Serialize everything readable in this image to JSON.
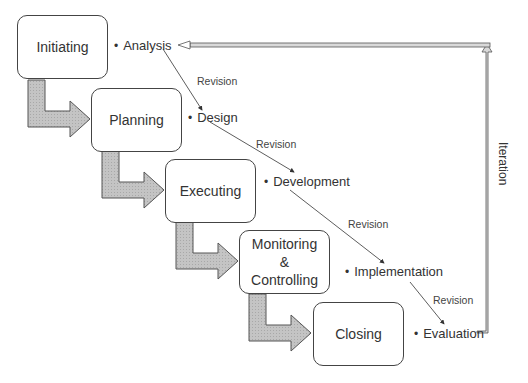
{
  "diagram": {
    "phases": [
      {
        "label": "Initiating"
      },
      {
        "label": "Planning"
      },
      {
        "label": "Executing"
      },
      {
        "label": "Monitoring & Controlling",
        "lines": [
          "Monitoring",
          "&",
          "Controlling"
        ]
      },
      {
        "label": "Closing"
      }
    ],
    "activities": [
      {
        "label": "Analysis"
      },
      {
        "label": "Design"
      },
      {
        "label": "Development"
      },
      {
        "label": "Implementation"
      },
      {
        "label": "Evaluation"
      }
    ],
    "revisions": [
      {
        "label": "Revision"
      },
      {
        "label": "Revision"
      },
      {
        "label": "Revision"
      },
      {
        "label": "Revision"
      }
    ],
    "iteration_label": "Iteration",
    "bullet": "•",
    "colors": {
      "phase_arrow_fill": "#c0c0c0",
      "phase_arrow_stroke": "#555555",
      "iteration_arrow_fill": "#d9d9d9",
      "box_border": "#444444",
      "line": "#333333"
    }
  }
}
